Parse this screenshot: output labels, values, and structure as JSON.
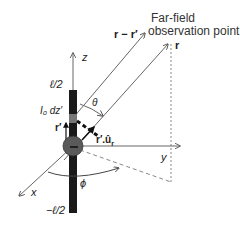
{
  "figure": {
    "title_line1": "Far-field",
    "title_line2": "observation point",
    "labels": {
      "r_minus_rprime": "r − r′",
      "r": "r",
      "z_axis": "z",
      "y_axis": "y",
      "x_axis": "x",
      "half_length_top": "ℓ/2",
      "half_length_bottom": "−ℓ/2",
      "current_element": "I₀ dz′",
      "r_prime": "r′",
      "projection": "r′.û",
      "projection_sub": "r",
      "theta": "θ",
      "phi": "ϕ"
    },
    "colors": {
      "dipole": "#1a1a1a",
      "center_sphere": "#555555",
      "lines": "#666666",
      "dashed": "#888888"
    }
  }
}
